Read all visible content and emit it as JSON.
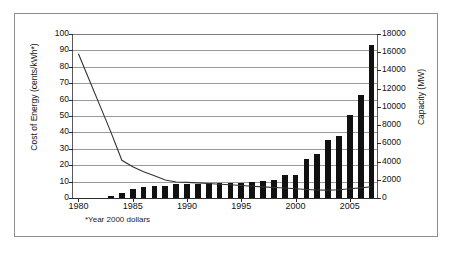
{
  "chart_data": {
    "type": "bar",
    "title": "",
    "subtitle": "",
    "xlabel": "",
    "ylabel": "Cost of Energy (cents/kWh*)",
    "y2label": "Capacity (MW)",
    "footnote": "*Year 2000 dollars",
    "grid": true,
    "legend": "none",
    "xlim": [
      1979.5,
      2007.5
    ],
    "ylim": [
      0,
      100
    ],
    "y2lim": [
      0,
      18000
    ],
    "x_tick_labels": [
      "1980",
      "1985",
      "1990",
      "1995",
      "2000",
      "2005"
    ],
    "x_ticks": [
      1980,
      1985,
      1990,
      1995,
      2000,
      2005
    ],
    "y_tick_labels": [
      "0",
      "10",
      "20",
      "30",
      "40",
      "50",
      "60",
      "70",
      "80",
      "90",
      "100"
    ],
    "y_ticks": [
      0,
      10,
      20,
      30,
      40,
      50,
      60,
      70,
      80,
      90,
      100
    ],
    "y2_tick_labels": [
      "0",
      "2000",
      "4000",
      "6000",
      "8000",
      "10000",
      "12000",
      "14000",
      "16000",
      "18000"
    ],
    "y2_ticks": [
      0,
      2000,
      4000,
      6000,
      8000,
      10000,
      12000,
      14000,
      16000,
      18000
    ],
    "x": [
      1980,
      1981,
      1982,
      1983,
      1984,
      1985,
      1986,
      1987,
      1988,
      1989,
      1990,
      1991,
      1992,
      1993,
      1994,
      1995,
      1996,
      1997,
      1998,
      1999,
      2000,
      2001,
      2002,
      2003,
      2004,
      2005,
      2006,
      2007
    ],
    "series": [
      {
        "name": "Capacity (MW)",
        "axis": "right",
        "render": "bar",
        "color": "#111111",
        "values": [
          0,
          0,
          0,
          170,
          520,
          1020,
          1250,
          1320,
          1290,
          1500,
          1540,
          1580,
          1620,
          1620,
          1650,
          1700,
          1780,
          1820,
          1980,
          2550,
          2560,
          4270,
          4800,
          6350,
          6800,
          9140,
          11300,
          16800
        ]
      },
      {
        "name": "Cost of Energy (cents/kWh*)",
        "axis": "left",
        "render": "line",
        "color": "#333333",
        "values": [
          88,
          72,
          56,
          40,
          23,
          19,
          16,
          13.5,
          11,
          9.8,
          9.5,
          9.2,
          8.8,
          8.4,
          8.1,
          7.6,
          7.2,
          6.8,
          6.4,
          6.1,
          5.6,
          5.2,
          4.9,
          4.8,
          5.0,
          5.6,
          6.2,
          6.9
        ]
      }
    ]
  },
  "axes": {
    "left_title": "Cost of Energy (cents/kWh*)",
    "right_title": "Capacity (MW)",
    "footnote": "*Year 2000 dollars"
  }
}
